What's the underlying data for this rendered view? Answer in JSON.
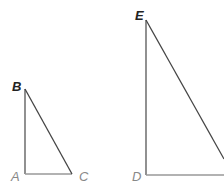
{
  "diagram": {
    "triangles": [
      {
        "name": "ABC",
        "vertices": {
          "A": [
            25,
            174
          ],
          "B": [
            25,
            89
          ],
          "C": [
            72,
            174
          ]
        },
        "right_angle_at": "A"
      },
      {
        "name": "DEF",
        "vertices": {
          "D": [
            146,
            175
          ],
          "E": [
            146,
            20
          ],
          "F": [
            224,
            175
          ]
        },
        "right_angle_at": "D"
      }
    ],
    "labels": {
      "A": "A",
      "B": "B",
      "C": "C",
      "D": "D",
      "E": "E"
    },
    "colors": {
      "line_dark": "#444444",
      "line_light": "#999999"
    }
  }
}
